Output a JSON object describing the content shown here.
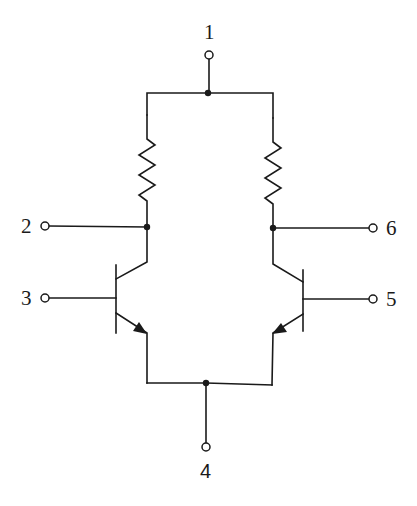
{
  "diagram": {
    "type": "circuit-schematic",
    "terminals": [
      {
        "id": "t1",
        "label": "1",
        "role": "common supply node (top of both resistors)"
      },
      {
        "id": "t2",
        "label": "2",
        "role": "left collector output"
      },
      {
        "id": "t3",
        "label": "3",
        "role": "left transistor base input"
      },
      {
        "id": "t4",
        "label": "4",
        "role": "common emitter node"
      },
      {
        "id": "t5",
        "label": "5",
        "role": "right transistor base input"
      },
      {
        "id": "t6",
        "label": "6",
        "role": "right collector output"
      }
    ],
    "components": [
      {
        "id": "R1",
        "kind": "resistor",
        "position": "left",
        "between": [
          "node-top",
          "node-left-collector"
        ]
      },
      {
        "id": "R2",
        "kind": "resistor",
        "position": "right",
        "between": [
          "node-top",
          "node-right-collector"
        ]
      },
      {
        "id": "Q1",
        "kind": "npn-transistor",
        "position": "left",
        "base": "t3",
        "collector": "node-left-collector",
        "emitter": "node-bottom"
      },
      {
        "id": "Q2",
        "kind": "npn-transistor",
        "position": "right",
        "base": "t5",
        "collector": "node-right-collector",
        "emitter": "node-bottom"
      }
    ],
    "junctions": [
      "node-top",
      "node-left-collector",
      "node-right-collector",
      "node-bottom"
    ],
    "colors": {
      "ink": "#1a1a1a",
      "background": "#ffffff"
    }
  }
}
